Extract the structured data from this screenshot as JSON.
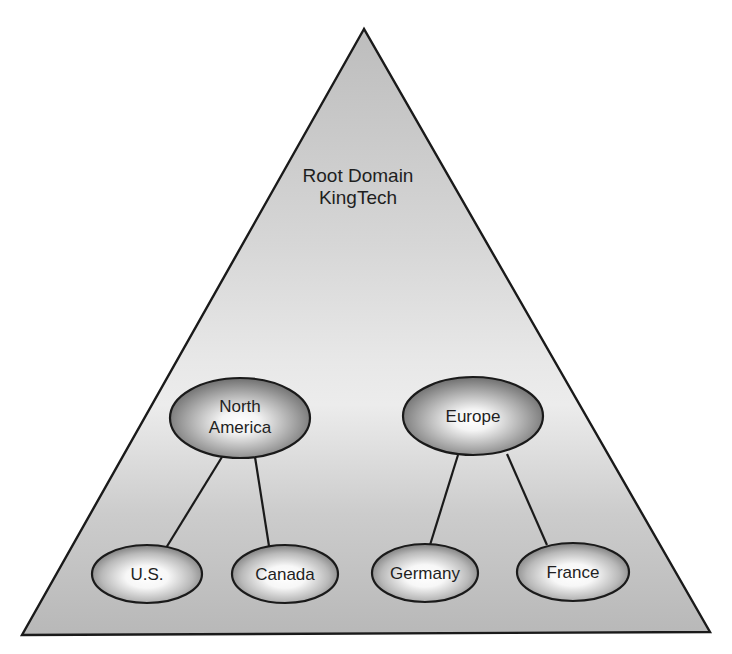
{
  "diagram": {
    "type": "domain-tree",
    "root": {
      "line1": "Root Domain",
      "line2": "KingTech"
    },
    "regions": [
      {
        "id": "north-america",
        "line1": "North",
        "line2": "America",
        "children": [
          "U.S.",
          "Canada"
        ]
      },
      {
        "id": "europe",
        "line1": "Europe",
        "children": [
          "Germany",
          "France"
        ]
      }
    ],
    "leaves": [
      {
        "id": "us",
        "label": "U.S.",
        "parent": "north-america"
      },
      {
        "id": "canada",
        "label": "Canada",
        "parent": "north-america"
      },
      {
        "id": "germany",
        "label": "Germany",
        "parent": "europe"
      },
      {
        "id": "france",
        "label": "France",
        "parent": "europe"
      }
    ],
    "colors": {
      "triangle_top": "#c8c8c8",
      "triangle_mid": "#e6e6e6",
      "triangle_bottom": "#bdbdbd",
      "outline": "#1a1a1a",
      "node_center": "#ffffff",
      "node_edge": "#7a7a7a",
      "text": "#1f1f1f"
    }
  }
}
